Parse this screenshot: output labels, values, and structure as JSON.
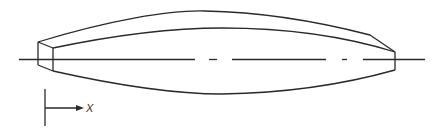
{
  "diagram": {
    "type": "technical-drawing",
    "colors": {
      "line": "#2a2a2a",
      "background": "#ffffff",
      "label": "#333333"
    },
    "axis": {
      "label": "X",
      "direction": "right"
    },
    "centerline": {
      "style": "dash-dot"
    }
  }
}
